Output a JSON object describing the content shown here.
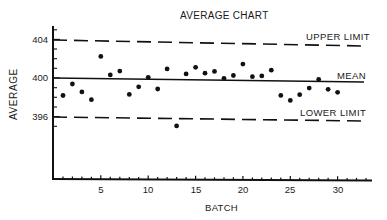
{
  "chart_data": {
    "type": "scatter",
    "title": "AVERAGE CHART",
    "xlabel": "BATCH",
    "ylabel": "AVERAGE",
    "x": [
      1,
      2,
      3,
      4,
      5,
      6,
      7,
      8,
      9,
      10,
      11,
      12,
      13,
      14,
      15,
      16,
      17,
      18,
      19,
      20,
      21,
      22,
      23,
      24,
      25,
      26,
      27,
      28,
      29,
      30
    ],
    "series": [
      {
        "name": "Batch average",
        "values": [
          398.2,
          399.4,
          398.6,
          397.8,
          402.3,
          400.4,
          400.8,
          398.4,
          399.2,
          400.2,
          399.0,
          401.1,
          395.2,
          400.6,
          401.3,
          400.7,
          400.9,
          400.2,
          400.5,
          401.7,
          400.4,
          400.5,
          401.1,
          398.5,
          398.0,
          398.6,
          399.3,
          400.2,
          399.2,
          398.9
        ]
      }
    ],
    "reference_lines": [
      {
        "name": "UPPER LIMIT",
        "value": 404,
        "style": "dashed"
      },
      {
        "name": "MEAN",
        "value": 400,
        "style": "solid"
      },
      {
        "name": "LOWER LIMIT",
        "value": 396,
        "style": "dashed"
      }
    ],
    "y_tick_labels": [
      "404",
      "400",
      "396"
    ],
    "x_tick_labels": [
      "5",
      "10",
      "15",
      "20",
      "25",
      "30"
    ],
    "xlim": [
      0,
      33
    ],
    "ylim": [
      389,
      405.5
    ],
    "grid": false,
    "legend": "none (inline line labels at right)"
  },
  "labels": {
    "title": "AVERAGE CHART",
    "xlabel": "BATCH",
    "ylabel": "AVERAGE",
    "upper": "UPPER LIMIT",
    "mean": "MEAN",
    "lower": "LOWER LIMIT",
    "y404": "404",
    "y400": "400",
    "y396": "396",
    "x5": "5",
    "x10": "10",
    "x15": "15",
    "x20": "20",
    "x25": "25",
    "x30": "30"
  }
}
